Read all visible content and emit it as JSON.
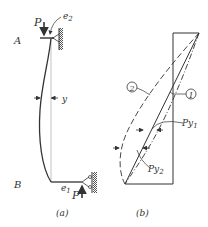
{
  "figure_a": {
    "caption": "(a)",
    "label_top": "A",
    "label_bottom": "B",
    "load_top": "P",
    "load_bottom": "P",
    "eccentricity_top": "e",
    "eccentricity_top_sub": "2",
    "eccentricity_bottom": "e",
    "eccentricity_bottom_sub": "1",
    "deflection": "y"
  },
  "figure_b": {
    "caption": "(b)",
    "curve_1": "1",
    "curve_2": "2",
    "moment_1": "Py",
    "moment_1_sub": "1",
    "moment_2": "Py",
    "moment_2_sub": "2"
  },
  "colors": {
    "ink": "#333333",
    "hatch": "#555555",
    "background": "#ffffff"
  }
}
